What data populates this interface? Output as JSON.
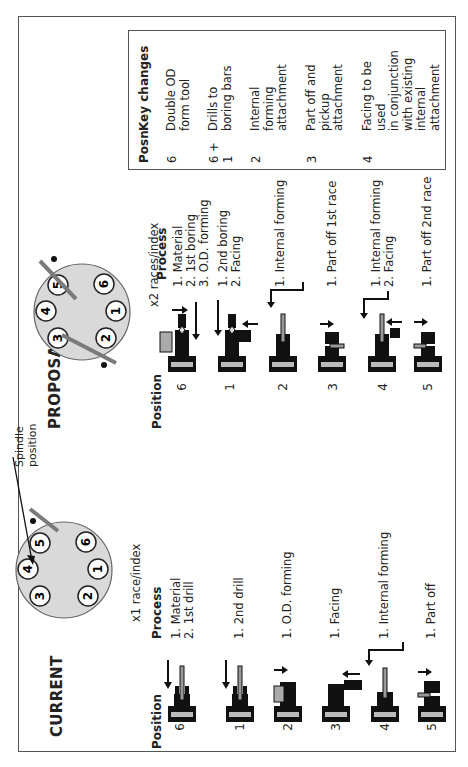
{
  "figure": {
    "header_fragment": "...",
    "current": {
      "title": "CURRENT",
      "spindle_label_line1": "Spindle",
      "spindle_label_line2": "position",
      "wheel_positions": [
        "1",
        "2",
        "3",
        "4",
        "5",
        "6"
      ],
      "rate": "x1 race/index",
      "position_header": "Position",
      "process_header": "Process",
      "rows": [
        {
          "position": "6",
          "process": [
            "1.  Material",
            "2.  1st drill"
          ]
        },
        {
          "position": "1",
          "process": [
            "1.  2nd drill"
          ]
        },
        {
          "position": "2",
          "process": [
            "1.  O.D. forming"
          ]
        },
        {
          "position": "3",
          "process": [
            "1.  Facing"
          ]
        },
        {
          "position": "4",
          "process": [
            "1.  Internal forming"
          ]
        },
        {
          "position": "5",
          "process": [
            "1.  Part off"
          ]
        }
      ]
    },
    "proposal": {
      "title": "PROPOSAL",
      "wheel_positions": [
        "1",
        "2",
        "3",
        "4",
        "5",
        "6"
      ],
      "rate": "x2 races/index",
      "position_header": "Position",
      "process_header": "Process",
      "rows": [
        {
          "position": "6",
          "process": [
            "1. Material",
            "2. 1st boring",
            "3. O.D. forming"
          ]
        },
        {
          "position": "1",
          "process": [
            "1. 2nd boring",
            "2. Facing"
          ]
        },
        {
          "position": "2",
          "process": [
            "1. Internal forming"
          ]
        },
        {
          "position": "3",
          "process": [
            "1. Part off 1st race"
          ]
        },
        {
          "position": "4",
          "process": [
            "1. Internal forming",
            "2. Facing"
          ]
        },
        {
          "position": "5",
          "process": [
            "1. Part off 2nd race"
          ]
        }
      ]
    },
    "key_changes": {
      "col_posn": "Posn",
      "col_changes": "Key changes",
      "rows": [
        {
          "posn": "6",
          "lines": [
            "Double OD",
            "form tool"
          ]
        },
        {
          "posn": "6 + 1",
          "lines": [
            "Drills to",
            "boring bars"
          ]
        },
        {
          "posn": "2",
          "lines": [
            "Internal",
            "forming",
            "attachment"
          ]
        },
        {
          "posn": "3",
          "lines": [
            "Part off and",
            "pickup",
            "attachment"
          ]
        },
        {
          "posn": "4",
          "lines": [
            "Facing to be",
            "used",
            "in conjunction",
            "with existing",
            "internal",
            "attachment"
          ]
        }
      ]
    },
    "colors": {
      "wheel_fill": "#d9d9d9",
      "bar": "#7a7a7a",
      "ink": "#111111"
    }
  }
}
